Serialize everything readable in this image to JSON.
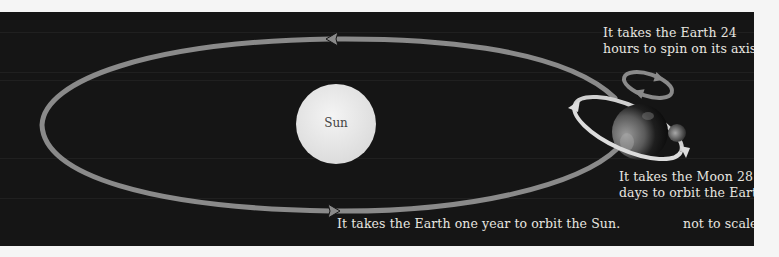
{
  "diagram": {
    "sun": {
      "label": "Sun"
    },
    "captions": {
      "earth_spin": [
        "It takes the Earth 24",
        "hours to spin on its axis."
      ],
      "moon_orbit": [
        "It takes the Moon 28",
        "days to orbit the Earth."
      ],
      "earth_orbit": "It takes the Earth one year to orbit the Sun.",
      "scale_note": "not to scale"
    },
    "colors": {
      "background": "#151515",
      "page": "#f5f5f5",
      "orbit_band": "#8a8a8a",
      "moon_orbit_band": "#d8d8d8",
      "sun": "#ececec",
      "text": "#e8e6e0"
    }
  }
}
